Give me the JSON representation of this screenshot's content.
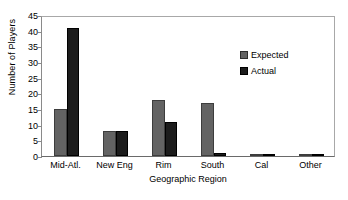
{
  "chart_data": {
    "type": "bar",
    "title": "",
    "xlabel": "Geographic Region",
    "ylabel": "Number of Players",
    "categories": [
      "Mid-Atl.",
      "New Eng",
      "Rim",
      "South",
      "Cal",
      "Other"
    ],
    "series": [
      {
        "name": "Expected",
        "color": "#636363",
        "values": [
          15,
          8,
          18,
          17,
          0.4,
          0.3
        ]
      },
      {
        "name": "Actual",
        "color": "#1c1c1c",
        "values": [
          41,
          8,
          11,
          1,
          0.4,
          0.6
        ]
      }
    ],
    "ylim": [
      0,
      45
    ],
    "ytick_step": 5,
    "yticks": [
      45,
      40,
      35,
      30,
      25,
      20,
      15,
      10,
      5,
      0
    ],
    "grid": false,
    "legend_position": "inside-top-right"
  }
}
